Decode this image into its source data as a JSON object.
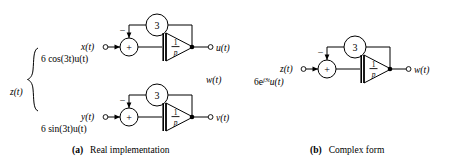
{
  "figure": {
    "background_color": "#ffffff",
    "line_color": "#000000"
  },
  "panels": [
    {
      "id": "panel-a",
      "caption_tag": "(a)",
      "caption_text": "Real implementation",
      "group_label": "z(t)",
      "has_brace": true,
      "branches": [
        {
          "id": "branch-cos",
          "source_expr": "6 cos(3t)u(t)",
          "input_label": "x(t)",
          "summer_symbol": "+",
          "negative_symbol": "−",
          "feedback_gain": "3",
          "integrator_numerator": "1",
          "integrator_denominator": "p",
          "output_label": "u(t)"
        },
        {
          "id": "branch-sin",
          "source_expr": "6 sin(3t)u(t)",
          "input_label": "y(t)",
          "summer_symbol": "+",
          "negative_symbol": "−",
          "feedback_gain": "3",
          "integrator_numerator": "1",
          "integrator_denominator": "p",
          "output_label": "v(t)"
        }
      ],
      "middle_label": "w(t)"
    },
    {
      "id": "panel-b",
      "caption_tag": "(b)",
      "caption_text": "Complex form",
      "branches": [
        {
          "id": "branch-complex",
          "source_expr_base": "6e",
          "source_expr_exp": "j3t",
          "source_expr_tail": "u(t)",
          "input_label": "z(t)",
          "summer_symbol": "+",
          "negative_symbol": "−",
          "feedback_gain": "3",
          "integrator_numerator": "1",
          "integrator_denominator": "p",
          "output_label": "w(t)"
        }
      ]
    }
  ]
}
